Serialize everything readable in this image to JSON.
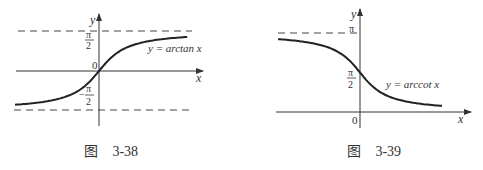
{
  "figures": [
    {
      "id": "fig-3-38",
      "caption_prefix": "图",
      "caption_number": "3-38",
      "function_label": "y = arctan x",
      "axis_x_label": "x",
      "axis_y_label": "y",
      "origin_label": "0",
      "upper_tick_num": "π",
      "upper_tick_den": "2",
      "lower_tick_num": "π",
      "lower_tick_den": "2",
      "lower_tick_sign": "−",
      "asymptotes": [
        "y = π/2",
        "y = −π/2"
      ]
    },
    {
      "id": "fig-3-39",
      "caption_prefix": "图",
      "caption_number": "3-39",
      "function_label": "y = arccot x",
      "axis_x_label": "x",
      "axis_y_label": "y",
      "origin_label": "0",
      "pi_tick": "π",
      "half_tick_num": "π",
      "half_tick_den": "2",
      "asymptotes": [
        "y = π"
      ]
    }
  ],
  "chart_data": [
    {
      "type": "line",
      "title": "图 3-38",
      "series": [
        {
          "name": "y = arctan x",
          "function": "arctan",
          "x_range": [
            -4,
            4.2
          ]
        }
      ],
      "xlabel": "x",
      "ylabel": "y",
      "ylim": [
        -2.2,
        2.2
      ],
      "yticks": [
        "-π/2",
        "0",
        "π/2"
      ],
      "asymptotes": [
        1.5708,
        -1.5708
      ]
    },
    {
      "type": "line",
      "title": "图 3-39",
      "series": [
        {
          "name": "y = arccot x",
          "function": "arccot",
          "x_range": [
            -4,
            4
          ]
        }
      ],
      "xlabel": "x",
      "ylabel": "y",
      "ylim": [
        0,
        3.6
      ],
      "yticks": [
        "0",
        "π/2",
        "π"
      ],
      "asymptotes": [
        3.1416
      ]
    }
  ]
}
